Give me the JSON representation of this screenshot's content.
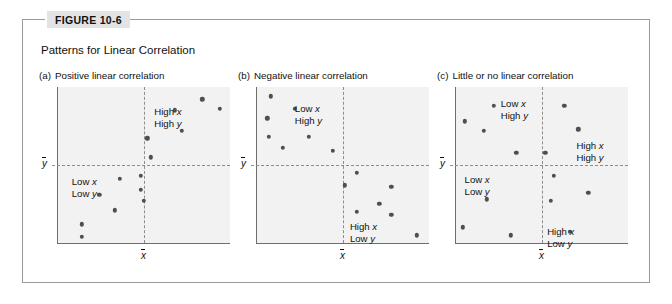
{
  "figure": {
    "tab_label": "FIGURE 10-6",
    "caption": "Patterns for Linear Correlation",
    "accent_color": "#e3e3e3",
    "border_color": "#9a9a9a",
    "plot_bg_color": "#f2f2f2",
    "dot_color": "#4f4f4f",
    "axis_color": "#6e6e6e",
    "guide_color": "#8d8d8d"
  },
  "axis_labels": {
    "x_mean": "x",
    "y_mean": "y"
  },
  "chart_data": [
    {
      "type": "scatter",
      "panel": "(a)",
      "title": "Positive linear correlation",
      "xlabel": "x",
      "ylabel": "y",
      "xlim": [
        0,
        100
      ],
      "ylim": [
        0,
        100
      ],
      "grid": false,
      "mean_x": 50,
      "mean_y": 50,
      "annotations": [
        {
          "text_line1": "High x",
          "text_line2": "High y",
          "quadrant": "upper-right",
          "x": 56,
          "y": 88
        },
        {
          "text_line1": "Low x",
          "text_line2": "Low y",
          "quadrant": "lower-left",
          "x": 8,
          "y": 43
        }
      ],
      "points": [
        {
          "x": 50,
          "y": 27
        },
        {
          "x": 48,
          "y": 34
        },
        {
          "x": 48,
          "y": 43
        },
        {
          "x": 36,
          "y": 41
        },
        {
          "x": 24,
          "y": 31
        },
        {
          "x": 33,
          "y": 21
        },
        {
          "x": 14,
          "y": 12
        },
        {
          "x": 14,
          "y": 4
        },
        {
          "x": 54,
          "y": 55
        },
        {
          "x": 52,
          "y": 67
        },
        {
          "x": 72,
          "y": 72
        },
        {
          "x": 68,
          "y": 85
        },
        {
          "x": 84,
          "y": 92
        },
        {
          "x": 94,
          "y": 86
        }
      ]
    },
    {
      "type": "scatter",
      "panel": "(b)",
      "title": "Negative linear correlation",
      "xlabel": "x",
      "ylabel": "y",
      "xlim": [
        0,
        100
      ],
      "ylim": [
        0,
        100
      ],
      "grid": false,
      "mean_x": 50,
      "mean_y": 50,
      "annotations": [
        {
          "text_line1": "Low x",
          "text_line2": "High y",
          "quadrant": "upper-left",
          "x": 22,
          "y": 90
        },
        {
          "text_line1": "High x",
          "text_line2": "Low y",
          "quadrant": "lower-right",
          "x": 54,
          "y": 14
        }
      ],
      "points": [
        {
          "x": 8,
          "y": 94
        },
        {
          "x": 22,
          "y": 86
        },
        {
          "x": 6,
          "y": 80
        },
        {
          "x": 7,
          "y": 68
        },
        {
          "x": 30,
          "y": 68
        },
        {
          "x": 15,
          "y": 61
        },
        {
          "x": 44,
          "y": 59
        },
        {
          "x": 58,
          "y": 45
        },
        {
          "x": 51,
          "y": 37
        },
        {
          "x": 78,
          "y": 36
        },
        {
          "x": 71,
          "y": 25
        },
        {
          "x": 58,
          "y": 20
        },
        {
          "x": 78,
          "y": 18
        },
        {
          "x": 93,
          "y": 5
        }
      ]
    },
    {
      "type": "scatter",
      "panel": "(c)",
      "title": "Little or no linear correlation",
      "xlabel": "x",
      "ylabel": "y",
      "xlim": [
        0,
        100
      ],
      "ylim": [
        0,
        100
      ],
      "grid": false,
      "mean_x": 50,
      "mean_y": 50,
      "annotations": [
        {
          "text_line1": "Low x",
          "text_line2": "High y",
          "quadrant": "upper-left",
          "x": 26,
          "y": 93
        },
        {
          "text_line1": "High x",
          "text_line2": "High y",
          "quadrant": "right-middle",
          "x": 70,
          "y": 66
        },
        {
          "text_line1": "Low x",
          "text_line2": "Low y",
          "quadrant": "lower-left",
          "x": 5,
          "y": 44
        },
        {
          "text_line1": "High x",
          "text_line2": "Low y",
          "quadrant": "lower-right",
          "x": 53,
          "y": 11
        }
      ],
      "points": [
        {
          "x": 22,
          "y": 88
        },
        {
          "x": 63,
          "y": 88
        },
        {
          "x": 5,
          "y": 78
        },
        {
          "x": 16,
          "y": 72
        },
        {
          "x": 71,
          "y": 73
        },
        {
          "x": 35,
          "y": 58
        },
        {
          "x": 52,
          "y": 58
        },
        {
          "x": 57,
          "y": 43
        },
        {
          "x": 77,
          "y": 32
        },
        {
          "x": 55,
          "y": 27
        },
        {
          "x": 18,
          "y": 28
        },
        {
          "x": 4,
          "y": 10
        },
        {
          "x": 32,
          "y": 5
        },
        {
          "x": 66,
          "y": 7
        }
      ]
    }
  ]
}
